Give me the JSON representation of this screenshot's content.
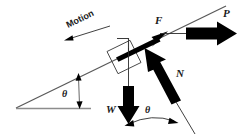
{
  "figure": {
    "type": "physics-free-body-diagram",
    "width": 243,
    "height": 140,
    "background_color": "#ffffff"
  },
  "labels": {
    "motion": "Motion",
    "force_friction": "F",
    "force_applied": "P",
    "force_normal": "N",
    "force_weight": "W",
    "angle_incline": "θ",
    "angle_weight_normal": "θ"
  },
  "colors": {
    "arrow_fill": "#000000",
    "incline_line": "#5a5a5a",
    "base_line": "#8c8c8c",
    "block_outline": "#4a4a4a",
    "text": "#1a1a1a"
  },
  "geometry": {
    "incline_angle_degrees": 22,
    "incline_start": [
      16,
      108
    ],
    "incline_end": [
      226,
      6
    ],
    "baseline_start": [
      16,
      108
    ],
    "baseline_end": [
      91,
      108
    ]
  },
  "vectors": [
    {
      "name": "F",
      "meaning": "friction force along incline",
      "direction": "up-the-slope",
      "style": "solid-black-tapered-arrow"
    },
    {
      "name": "P",
      "meaning": "applied horizontal force",
      "direction": "horizontal-right",
      "style": "solid-black-block-arrow"
    },
    {
      "name": "N",
      "meaning": "normal force perpendicular to incline",
      "direction": "up-right-perpendicular",
      "style": "solid-black-block-arrow"
    },
    {
      "name": "W",
      "meaning": "weight acting vertically downward",
      "direction": "vertical-down",
      "style": "solid-black-block-arrow"
    },
    {
      "name": "Motion",
      "meaning": "direction of motion down the slope",
      "direction": "down-the-slope",
      "style": "thin-line-arrow"
    }
  ]
}
